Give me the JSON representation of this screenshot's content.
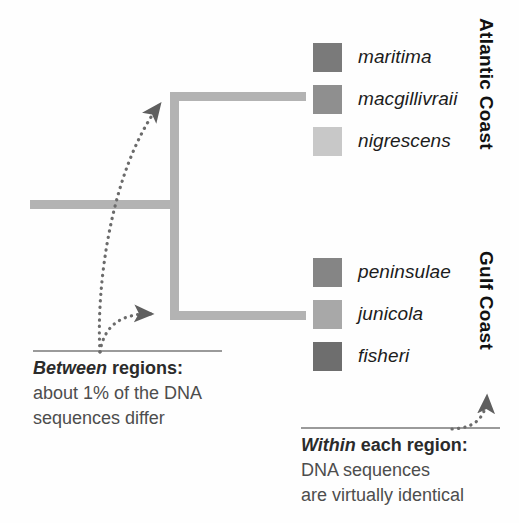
{
  "figure": {
    "title_cut_off": "",
    "background_color": "#ffffff"
  },
  "colors": {
    "branch": "#b3b3b3",
    "rule": "#9a9a9a",
    "pointer": "#666666",
    "label_text": "#1c1c1c",
    "annotation_text": "#4d4d4d",
    "annotation_head": "#2b2b2b"
  },
  "legend": {
    "atlantic": {
      "region_label": "Atlantic Coast",
      "items": [
        {
          "name": "maritima",
          "swatch_color": "#7a7a7a"
        },
        {
          "name": "macgillivraii",
          "swatch_color": "#8f8f8f"
        },
        {
          "name": "nigrescens",
          "swatch_color": "#c8c8c8"
        }
      ]
    },
    "gulf": {
      "region_label": "Gulf Coast",
      "items": [
        {
          "name": "peninsulae",
          "swatch_color": "#858585"
        },
        {
          "name": "junicola",
          "swatch_color": "#a8a8a8"
        },
        {
          "name": "fisheri",
          "swatch_color": "#6e6e6e"
        }
      ]
    }
  },
  "annotations": {
    "between": {
      "head_emphasis": "Between",
      "head_rest": " regions:",
      "line2": "about 1% of the DNA",
      "line3": "sequences differ"
    },
    "within": {
      "head_emphasis": "Within",
      "head_rest": " each region:",
      "line2": "DNA sequences",
      "line3": "are virtually identical"
    }
  },
  "tree": {
    "type": "cladogram",
    "root_label": "",
    "nodes": [
      {
        "id": "root",
        "x": 30,
        "y": 204
      },
      {
        "id": "split",
        "x": 174,
        "y": 204
      },
      {
        "id": "atlantic",
        "x": 306,
        "y": 96
      },
      {
        "id": "gulf",
        "x": 306,
        "y": 315
      }
    ],
    "clades": [
      "Atlantic Coast",
      "Gulf Coast"
    ]
  },
  "pointers": [
    {
      "name": "pointer-between-to-atlantic",
      "from": [
        100,
        350
      ],
      "to": [
        165,
        96
      ],
      "style": "dotted-curve-arrow"
    },
    {
      "name": "pointer-between-to-gulf",
      "from": [
        100,
        350
      ],
      "to": [
        166,
        315
      ],
      "style": "dotted-curve-arrow"
    },
    {
      "name": "pointer-within-to-gulf",
      "from": [
        455,
        429
      ],
      "to": [
        487,
        386
      ],
      "style": "dotted-curve-arrow"
    }
  ]
}
